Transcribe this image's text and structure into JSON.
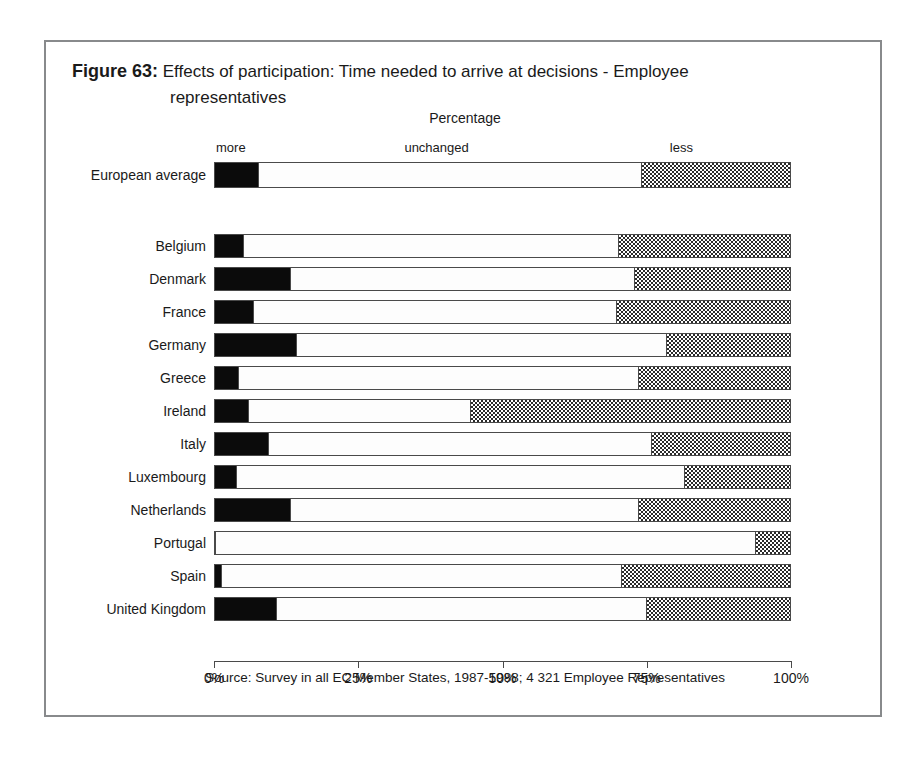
{
  "figure": {
    "number_label": "Figure 63:",
    "title_line1": "Effects of participation: Time needed to arrive at decisions - Employee",
    "title_line2": "representatives",
    "axis_title": "Percentage",
    "source": "Source: Survey in all EC Member States, 1987-1988; 4 321 Employee Representatives"
  },
  "legend": {
    "more": "more",
    "unchanged": "unchanged",
    "less": "less"
  },
  "axis": {
    "ticks": [
      "0%",
      "25%",
      "50%",
      "75%",
      "100%"
    ],
    "tick_values": [
      0,
      25,
      50,
      75,
      100
    ]
  },
  "colors": {
    "more": "#0b0b0b",
    "unchanged": "#fdfdfd",
    "less": "#bfbfbf",
    "outline": "#4a4a4a",
    "frame": "#888a8c"
  },
  "chart_data": {
    "type": "bar",
    "orientation": "horizontal",
    "stacked": true,
    "title": "Effects of participation: Time needed to arrive at decisions - Employee representatives",
    "xlabel": "Percentage",
    "ylabel": "",
    "xlim": [
      0,
      100
    ],
    "grid": false,
    "legend_position": "above-first-bar",
    "series": [
      {
        "name": "more",
        "values": [
          7.5,
          4.8,
          13.0,
          6.6,
          14.0,
          4.0,
          5.7,
          9.2,
          3.6,
          13.0,
          0.0,
          1.0,
          10.5
        ]
      },
      {
        "name": "unchanged",
        "values": [
          66.7,
          65.4,
          60.0,
          63.2,
          64.5,
          69.6,
          38.8,
          66.7,
          78.0,
          60.6,
          94.0,
          69.7,
          64.5
        ]
      },
      {
        "name": "less",
        "values": [
          25.8,
          29.8,
          27.0,
          30.2,
          21.5,
          26.4,
          55.5,
          24.1,
          18.4,
          26.4,
          6.0,
          29.3,
          25.0
        ]
      }
    ],
    "categories": [
      "European average",
      "Belgium",
      "Denmark",
      "France",
      "Germany",
      "Greece",
      "Ireland",
      "Italy",
      "Luxembourg",
      "Netherlands",
      "Portugal",
      "Spain",
      "United Kingdom"
    ]
  },
  "rows": [
    {
      "label": "European average",
      "more": 7.5,
      "unchanged": 66.7,
      "less": 25.8,
      "group": "average"
    },
    {
      "label": "Belgium",
      "more": 4.8,
      "unchanged": 65.4,
      "less": 29.8,
      "group": "country"
    },
    {
      "label": "Denmark",
      "more": 13.0,
      "unchanged": 60.0,
      "less": 27.0,
      "group": "country"
    },
    {
      "label": "France",
      "more": 6.6,
      "unchanged": 63.2,
      "less": 30.2,
      "group": "country"
    },
    {
      "label": "Germany",
      "more": 14.0,
      "unchanged": 64.5,
      "less": 21.5,
      "group": "country"
    },
    {
      "label": "Greece",
      "more": 4.0,
      "unchanged": 69.6,
      "less": 26.4,
      "group": "country"
    },
    {
      "label": "Ireland",
      "more": 5.7,
      "unchanged": 38.8,
      "less": 55.5,
      "group": "country"
    },
    {
      "label": "Italy",
      "more": 9.2,
      "unchanged": 66.7,
      "less": 24.1,
      "group": "country"
    },
    {
      "label": "Luxembourg",
      "more": 3.6,
      "unchanged": 78.0,
      "less": 18.4,
      "group": "country"
    },
    {
      "label": "Netherlands",
      "more": 13.0,
      "unchanged": 60.6,
      "less": 26.4,
      "group": "country"
    },
    {
      "label": "Portugal",
      "more": 0.0,
      "unchanged": 94.0,
      "less": 6.0,
      "group": "country"
    },
    {
      "label": "Spain",
      "more": 1.0,
      "unchanged": 69.7,
      "less": 29.3,
      "group": "country"
    },
    {
      "label": "United Kingdom",
      "more": 10.5,
      "unchanged": 64.5,
      "less": 25.0,
      "group": "country"
    }
  ]
}
